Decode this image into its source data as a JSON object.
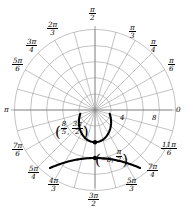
{
  "figure": {
    "type": "polar-plot",
    "background": "#ffffff",
    "curve_color": "#000000",
    "grid_color": "#9a9a9a",
    "axis_color": "#808080"
  },
  "angle_labels": [
    {
      "name": "angle-0",
      "text": "0",
      "num": "",
      "den": "",
      "frac": false,
      "x": 176,
      "y": 105
    },
    {
      "name": "angle-pi-6",
      "text": "",
      "num": "π",
      "den": "6",
      "frac": true,
      "x": 168,
      "y": 57
    },
    {
      "name": "angle-pi-4",
      "text": "",
      "num": "π",
      "den": "4",
      "frac": true,
      "x": 150,
      "y": 38
    },
    {
      "name": "angle-pi-3",
      "text": "",
      "num": "π",
      "den": "3",
      "frac": true,
      "x": 129,
      "y": 24
    },
    {
      "name": "angle-pi-2",
      "text": "",
      "num": "π",
      "den": "2",
      "frac": true,
      "x": 89,
      "y": 6
    },
    {
      "name": "angle-2pi-3",
      "text": "",
      "num": "2π",
      "den": "3",
      "frac": true,
      "x": 47,
      "y": 21
    },
    {
      "name": "angle-3pi-4",
      "text": "",
      "num": "3π",
      "den": "4",
      "frac": true,
      "x": 26,
      "y": 38
    },
    {
      "name": "angle-5pi-6",
      "text": "",
      "num": "5π",
      "den": "6",
      "frac": true,
      "x": 12,
      "y": 57
    },
    {
      "name": "angle-pi",
      "text": "π",
      "num": "",
      "den": "",
      "frac": false,
      "x": 4,
      "y": 105
    },
    {
      "name": "angle-7pi-6",
      "text": "",
      "num": "7π",
      "den": "6",
      "frac": true,
      "x": 12,
      "y": 142
    },
    {
      "name": "angle-5pi-4",
      "text": "",
      "num": "5π",
      "den": "4",
      "frac": true,
      "x": 28,
      "y": 165
    },
    {
      "name": "angle-4pi-3",
      "text": "",
      "num": "4π",
      "den": "3",
      "frac": true,
      "x": 48,
      "y": 177
    },
    {
      "name": "angle-3pi-2",
      "text": "",
      "num": "3π",
      "den": "2",
      "frac": true,
      "x": 88,
      "y": 192
    },
    {
      "name": "angle-5pi-3",
      "text": "",
      "num": "5π",
      "den": "3",
      "frac": true,
      "x": 126,
      "y": 177
    },
    {
      "name": "angle-7pi-4",
      "text": "",
      "num": "7π",
      "den": "4",
      "frac": true,
      "x": 147,
      "y": 163
    },
    {
      "name": "angle-11pi-6",
      "text": "",
      "num": "11π",
      "den": "6",
      "frac": true,
      "x": 161,
      "y": 141
    }
  ],
  "radial_ticks": [
    {
      "name": "radial-tick-4",
      "label": "4",
      "value": 4,
      "x": 120,
      "y": 114
    },
    {
      "name": "radial-tick-8",
      "label": "8",
      "value": 8,
      "x": 152,
      "y": 114
    }
  ],
  "annotations": [
    {
      "name": "point-label-lower",
      "r_num": "8",
      "r_den": "5",
      "r_frac": true,
      "r_text": "",
      "t_num": "3π",
      "t_den": "2",
      "t_frac": true,
      "x": 55,
      "y": 121
    },
    {
      "name": "point-label-upper",
      "r_num": "",
      "r_den": "",
      "r_frac": false,
      "r_text": "−8",
      "t_num": "π",
      "t_den": "2",
      "t_frac": true,
      "x": 95,
      "y": 149
    }
  ],
  "chart_data": {
    "type": "line",
    "coordinate_system": "polar",
    "title": "",
    "xlabel": "",
    "ylabel": "",
    "rlim": [
      0,
      10
    ],
    "r_ticks": [
      2,
      4,
      6,
      8,
      10
    ],
    "r_tick_labels": [
      "",
      "4",
      "",
      "8",
      ""
    ],
    "theta_ticks_labels": [
      "0",
      "π/6",
      "π/4",
      "π/3",
      "π/2",
      "2π/3",
      "3π/4",
      "5π/6",
      "π",
      "7π/6",
      "5π/4",
      "4π/3",
      "3π/2",
      "5π/3",
      "7π/4",
      "11π/6"
    ],
    "grid": true,
    "legend": "none",
    "marked_points": [
      {
        "label": "(8/5, 3π/2)",
        "r": 1.6,
        "theta": "3π/2"
      },
      {
        "label": "(−8, π/2)",
        "r": -8,
        "theta": "π/2"
      }
    ],
    "series": [
      {
        "name": "branch-upper",
        "description": "U-shaped branch opening upward, vertex near r=1.6 at 3π/2"
      },
      {
        "name": "branch-lower",
        "description": "arch branch opening downward, vertex marked at (−8, π/2)"
      }
    ]
  }
}
